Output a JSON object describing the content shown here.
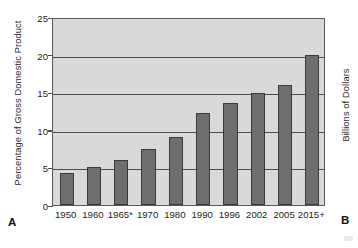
{
  "figure": {
    "panel_a_letter": "A",
    "panel_b_letter": "B"
  },
  "panel_a": {
    "y_axis_title": "Percentage of Gross Domestic Product"
  },
  "panel_b": {
    "y_axis_title": "Billions of Dollars"
  },
  "chart_data": {
    "type": "bar",
    "title": "",
    "xlabel": "",
    "ylabel": "Percentage of Gross Domestic Product",
    "categories": [
      "1950",
      "1960",
      "1965*",
      "1970",
      "1980",
      "1990",
      "1996",
      "2002",
      "2005",
      "2015+"
    ],
    "values": [
      4.3,
      5.0,
      6.0,
      7.4,
      9.1,
      12.2,
      13.6,
      14.9,
      16.0,
      20.0
    ],
    "ylim": [
      0,
      25
    ],
    "yticks": [
      0,
      5,
      10,
      15,
      20,
      25
    ],
    "ytick_labels": [
      "0",
      "5",
      "10",
      "15",
      "20",
      "25"
    ],
    "grid": true,
    "grid_axis": "y",
    "legend": false,
    "bar_color": "#6e6e6e",
    "bar_edge_color": "#3a3a3a",
    "plot_background": "#d9d9d9",
    "axis_color": "#4d4d4d"
  }
}
